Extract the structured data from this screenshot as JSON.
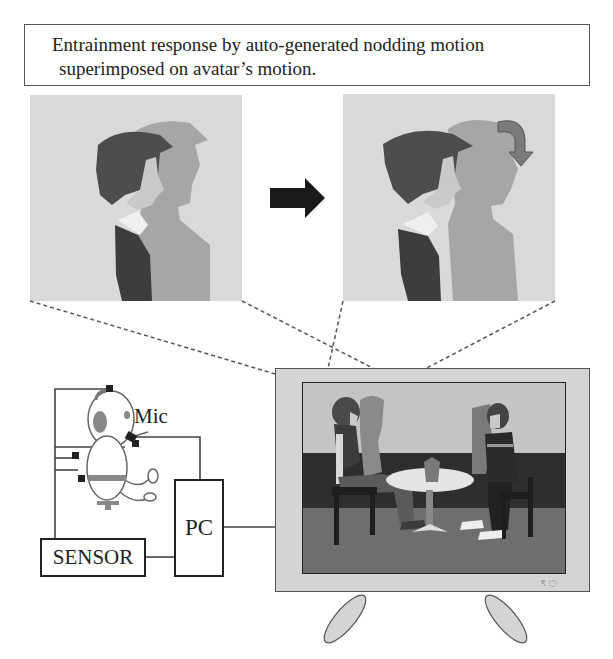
{
  "title": {
    "line1": "Entrainment response by auto-generated nodding motion",
    "line2": "superimposed on avatar’s motion."
  },
  "panels": {
    "before": {
      "label": "avatar-before-nod",
      "icon": "avatar-profile-image"
    },
    "after": {
      "label": "avatar-after-nod",
      "icon": "avatar-profile-image",
      "nod_indicator": "curved-arrow-down-icon"
    },
    "transition_icon": "right-arrow-icon"
  },
  "setup": {
    "mic_label": "Mic",
    "pc_label": "PC",
    "sensor_label": "SENSOR",
    "user_icon": "seated-user-with-headset-icon"
  },
  "display": {
    "icon": "monitor-icon",
    "scene": "two-avatars-at-table",
    "indicator_text": "ৎ ◌"
  },
  "colors": {
    "ink": "#222222",
    "panel_bg": "#d9d9d9",
    "tv_bezel": "#d4d4d4",
    "wall": "#c4c4c4",
    "baseboard": "#2e2e2e",
    "floor": "#6e6e6e",
    "avatar_dark": "#4a4a4a",
    "avatar_ghost": "#9a9a9a",
    "nod_arrow": "#7a7a7a"
  }
}
